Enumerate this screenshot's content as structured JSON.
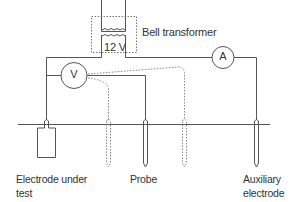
{
  "diagram": {
    "transformer": {
      "label": "Bell transformer",
      "voltage": "12 V"
    },
    "meters": {
      "voltmeter": "V",
      "ammeter": "A"
    },
    "labels": {
      "electrode_under_test_line1": "Electrode under",
      "electrode_under_test_line2": "test",
      "probe": "Probe",
      "auxiliary_line1": "Auxiliary",
      "auxiliary_line2": "electrode"
    },
    "colors": {
      "line": "#555555",
      "text": "#333333",
      "background": "#ffffff"
    }
  }
}
